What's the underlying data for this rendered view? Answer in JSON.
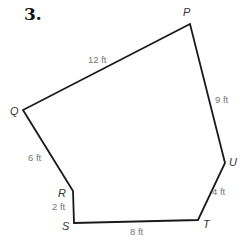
{
  "problem": {
    "number": "3."
  },
  "figure": {
    "type": "hexagon",
    "line_color": "#1a1a1a",
    "vertices": [
      {
        "name": "P",
        "x": 190,
        "y": 24,
        "label_x": 183,
        "label_y": 16
      },
      {
        "name": "Q",
        "x": 23,
        "y": 110,
        "label_x": 10,
        "label_y": 115
      },
      {
        "name": "R",
        "x": 73,
        "y": 191,
        "label_x": 58,
        "label_y": 197
      },
      {
        "name": "S",
        "x": 74,
        "y": 223,
        "label_x": 62,
        "label_y": 230
      },
      {
        "name": "T",
        "x": 198,
        "y": 220,
        "label_x": 203,
        "label_y": 228
      },
      {
        "name": "U",
        "x": 225,
        "y": 163,
        "label_x": 229,
        "label_y": 166
      }
    ],
    "sides": [
      {
        "from": "P",
        "to": "Q",
        "length": "12 ft",
        "label_x": 88,
        "label_y": 63
      },
      {
        "from": "Q",
        "to": "R",
        "length": "6 ft",
        "label_x": 28,
        "label_y": 161
      },
      {
        "from": "R",
        "to": "S",
        "length": "2 ft",
        "label_x": 52,
        "label_y": 210
      },
      {
        "from": "S",
        "to": "T",
        "length": "8 ft",
        "label_x": 130,
        "label_y": 235
      },
      {
        "from": "T",
        "to": "U",
        "length": "4 ft",
        "label_x": 212,
        "label_y": 195
      },
      {
        "from": "U",
        "to": "P",
        "length": "9 ft",
        "label_x": 215,
        "label_y": 103
      }
    ]
  }
}
